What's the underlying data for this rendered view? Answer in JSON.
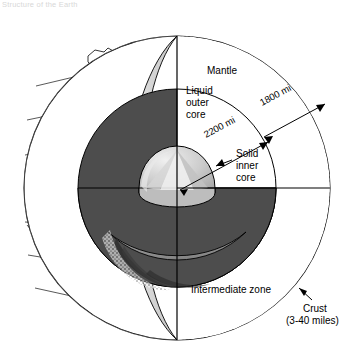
{
  "caption": {
    "text": "Structure of the Earth"
  },
  "figure": {
    "type": "cross-section cutaway globe"
  },
  "labels": {
    "mantle": "Mantle",
    "liquid_outer_core_line1": "Liquid",
    "liquid_outer_core_line2": "outer",
    "liquid_outer_core_line3": "core",
    "solid_inner_core_line1": "Solid",
    "solid_inner_core_line2": "inner",
    "solid_inner_core_line3": "core",
    "intermediate_zone": "Intermediate zone",
    "crust_line1": "Crust",
    "crust_line2": "(3-40 miles)"
  },
  "dimensions": {
    "inner_radius": "2200 mi",
    "outer_radius": "1800 mi"
  },
  "colors": {
    "outline": "#000000",
    "mantle_fill": "#ffffff",
    "intermediate_fill": "#4d4d4d",
    "outer_core_fill": "#8c8c8c",
    "inner_core_fill": "#c9c9c9",
    "globe_shell": "#d9d9d9",
    "crust_stipple": "#000000",
    "background": "#ffffff"
  },
  "layers": [
    {
      "name": "Crust",
      "thickness": "3-40 miles"
    },
    {
      "name": "Mantle",
      "depth_note": "1800 mi"
    },
    {
      "name": "Intermediate zone",
      "depth_note": ""
    },
    {
      "name": "Liquid outer core",
      "depth_note": "2200 mi"
    },
    {
      "name": "Solid inner core",
      "depth_note": ""
    }
  ]
}
